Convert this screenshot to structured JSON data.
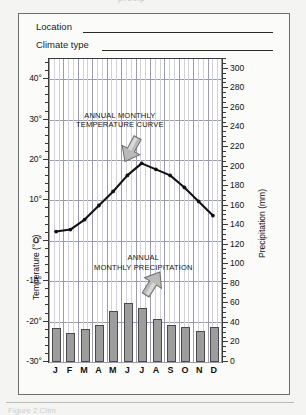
{
  "page": {
    "top_cut_fragment": "precip",
    "bottom_cut_fragment": "Figure 2  Clim"
  },
  "form": {
    "location_label": "Location",
    "climate_type_label": "Climate type",
    "location_value": "",
    "climate_type_value": ""
  },
  "axes": {
    "left_title": "Temperature (°C)",
    "right_title": "Precipitation (mm)",
    "left_ticks": [
      "40°",
      "30°",
      "20°",
      "10°",
      "0°",
      "-10°",
      "-20°",
      "-30°"
    ],
    "right_ticks": [
      "300",
      "280",
      "260",
      "240",
      "220",
      "200",
      "180",
      "160",
      "140",
      "120",
      "100",
      "80",
      "60",
      "40",
      "20",
      "0"
    ],
    "month_labels": [
      "J",
      "F",
      "M",
      "A",
      "M",
      "J",
      "J",
      "A",
      "S",
      "O",
      "N",
      "D"
    ]
  },
  "annotations": {
    "temperature": {
      "line1": "ANNUAL MONTHLY",
      "line2": "TEMPERATURE CURVE"
    },
    "precipitation": {
      "line1": "ANNUAL",
      "line2": "MONTHLY PRECIPITATION"
    }
  },
  "colors": {
    "bar_fill": "#9d9d9d",
    "bar_stroke": "#4a4a4a",
    "curve": "#111111",
    "grid_major": "#9a9ab0",
    "grid_minor": "#d2d2dd",
    "arrow_fill": "#b9b9b9",
    "card_bg": "#fbfbf9",
    "page_bg": "#f4f4f2"
  },
  "chart_data": {
    "type": "line",
    "title": "",
    "subtitle": "",
    "xlabel": "",
    "ylabel": "Temperature (°C)",
    "y2label": "Precipitation (mm)",
    "categories": [
      "J",
      "F",
      "M",
      "A",
      "M",
      "J",
      "J",
      "A",
      "S",
      "O",
      "N",
      "D"
    ],
    "ylim": [
      -30,
      45
    ],
    "y_ticks": [
      -30,
      -20,
      -10,
      0,
      10,
      20,
      30,
      40
    ],
    "y2lim": [
      0,
      310
    ],
    "y2_ticks": [
      0,
      20,
      40,
      60,
      80,
      100,
      120,
      140,
      160,
      180,
      200,
      220,
      240,
      260,
      280,
      300
    ],
    "grid": true,
    "legend": "none",
    "series": [
      {
        "name": "Annual monthly temperature curve",
        "type": "line",
        "axis": "left",
        "unit": "°C",
        "values": [
          2,
          2.5,
          5,
          8.5,
          12,
          16,
          19,
          17.5,
          16,
          13,
          9.5,
          6
        ]
      },
      {
        "name": "Annual monthly precipitation",
        "type": "bar",
        "axis": "right",
        "unit": "mm",
        "values": [
          35,
          30,
          34,
          38,
          52,
          60,
          55,
          44,
          38,
          36,
          32,
          36
        ]
      }
    ],
    "annotations": [
      {
        "text": "ANNUAL MONTHLY TEMPERATURE CURVE",
        "points_to": "temperature line peak (July)"
      },
      {
        "text": "ANNUAL MONTHLY PRECIPITATION",
        "points_to": "precipitation bar (July)"
      }
    ]
  }
}
